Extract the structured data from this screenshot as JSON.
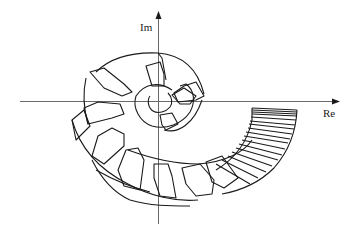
{
  "diagram": {
    "type": "complex-plane value-set plot (Nyquist templates)",
    "axes": {
      "x_label": "Re",
      "y_label": "Im"
    },
    "colors": {
      "background": "#ffffff",
      "stroke": "#1a1a1a",
      "axis": "#6a6a6a"
    },
    "elements": [
      "inner spiral of small templates around origin",
      "middle ring of arc-shaped templates",
      "outer ring of hexagonal templates sweeping through third and fourth quadrants",
      "dense cluster of thin templates near the positive real axis below it"
    ]
  }
}
